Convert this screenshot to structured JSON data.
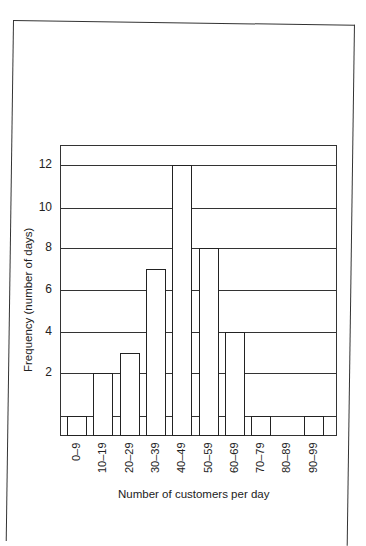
{
  "chart_data": {
    "type": "bar",
    "title": "",
    "xlabel": "Number of customers per day",
    "ylabel": "Frequency (number of days)",
    "categories": [
      "0–9",
      "10–19",
      "20–29",
      "30–39",
      "40–49",
      "50–59",
      "60–69",
      "70–79",
      "80–89",
      "90–99"
    ],
    "values": [
      1,
      2,
      3,
      7,
      12,
      8,
      4,
      1,
      0,
      1
    ],
    "yticks": [
      2,
      4,
      6,
      8,
      10,
      12
    ],
    "ylim": [
      0,
      13
    ],
    "grid": true,
    "legend": null
  }
}
